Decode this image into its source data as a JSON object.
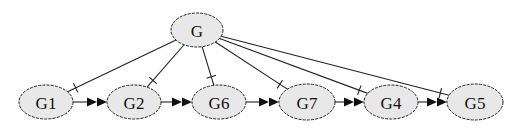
{
  "diagram": {
    "type": "directed-graph",
    "colors": {
      "node_fill": "#e8e8e8",
      "node_stroke": "#222222",
      "edge": "#222222",
      "arrow": "#111111",
      "background": "#ffffff"
    },
    "nodes": [
      {
        "id": "G",
        "label": "G",
        "cx": 197,
        "cy": 30,
        "rx": 26,
        "ry": 17
      },
      {
        "id": "G1",
        "label": "G1",
        "cx": 46,
        "cy": 102,
        "rx": 27,
        "ry": 17
      },
      {
        "id": "G2",
        "label": "G2",
        "cx": 134,
        "cy": 102,
        "rx": 27,
        "ry": 17
      },
      {
        "id": "G6",
        "label": "G6",
        "cx": 219,
        "cy": 102,
        "rx": 27,
        "ry": 17
      },
      {
        "id": "G7",
        "label": "G7",
        "cx": 307,
        "cy": 102,
        "rx": 28,
        "ry": 18
      },
      {
        "id": "G4",
        "label": "G4",
        "cx": 391,
        "cy": 102,
        "rx": 27,
        "ry": 17
      },
      {
        "id": "G5",
        "label": "G5",
        "cx": 475,
        "cy": 102,
        "rx": 28,
        "ry": 18
      }
    ],
    "edges": [
      {
        "from": "G",
        "to": "G1",
        "style": "tee"
      },
      {
        "from": "G",
        "to": "G2",
        "style": "tee"
      },
      {
        "from": "G",
        "to": "G6",
        "style": "tee"
      },
      {
        "from": "G",
        "to": "G7",
        "style": "tee"
      },
      {
        "from": "G",
        "to": "G4",
        "style": "tee"
      },
      {
        "from": "G",
        "to": "G5",
        "style": "tee"
      },
      {
        "from": "G1",
        "to": "G2",
        "style": "double-arrow"
      },
      {
        "from": "G2",
        "to": "G6",
        "style": "double-arrow"
      },
      {
        "from": "G6",
        "to": "G7",
        "style": "double-arrow"
      },
      {
        "from": "G7",
        "to": "G4",
        "style": "double-arrow"
      },
      {
        "from": "G4",
        "to": "G5",
        "style": "double-arrow"
      }
    ]
  }
}
